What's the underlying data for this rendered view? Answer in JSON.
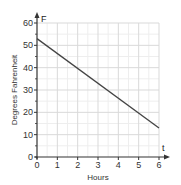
{
  "chart_data": {
    "type": "line",
    "title": "",
    "xlabel": "Hours",
    "ylabel": "Degrees Fahrenheit",
    "x_axis_variable": "t",
    "y_axis_variable": "F",
    "xlim": [
      0,
      6
    ],
    "ylim": [
      0,
      60
    ],
    "x_ticks": [
      0,
      1,
      2,
      3,
      4,
      5,
      6
    ],
    "y_ticks": [
      0,
      10,
      20,
      30,
      40,
      50,
      60
    ],
    "grid": true,
    "legend": null,
    "series": [
      {
        "name": "temperature",
        "x": [
          0,
          6
        ],
        "y": [
          53,
          13
        ]
      }
    ]
  },
  "colors": {
    "line": "#444444",
    "axis": "#333333",
    "grid_major": "#d9d9d9",
    "grid_minor": "#eeeeee"
  }
}
